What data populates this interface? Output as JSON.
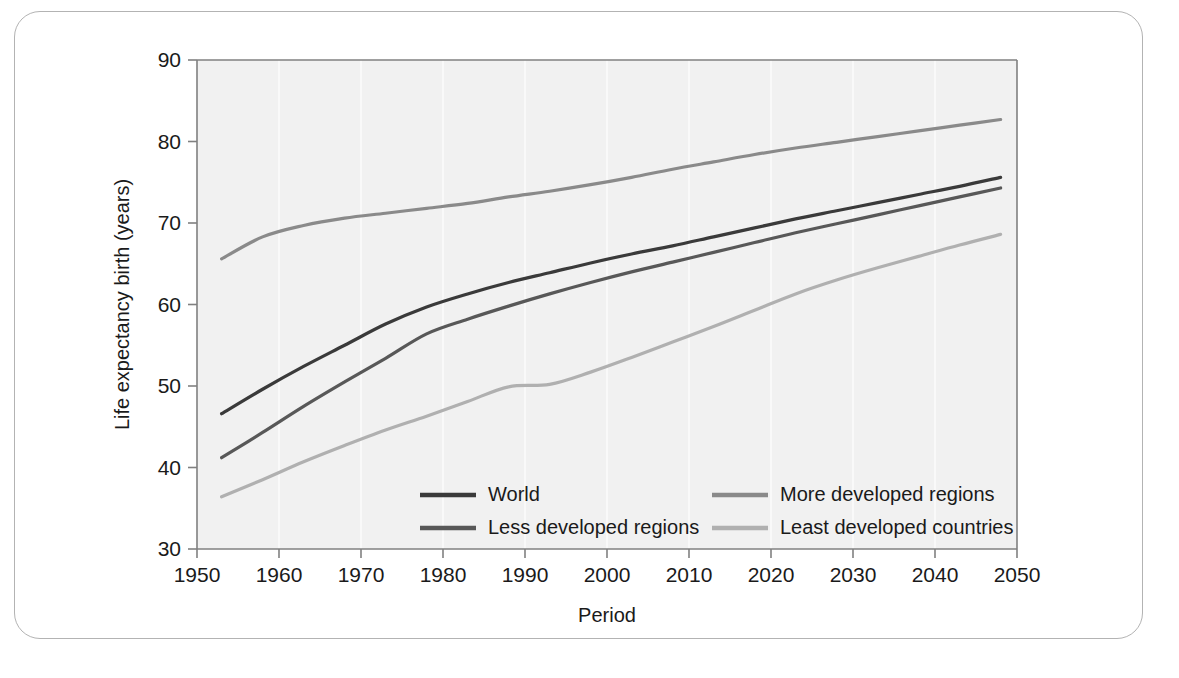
{
  "figure": {
    "background": "#ffffff",
    "frame_color": "#b3b3b3",
    "plot_background": "#f1f1f1"
  },
  "chart_data": {
    "type": "line",
    "title": "",
    "xlabel": "Period",
    "ylabel": "Life expectancy birth (years)",
    "xlim": [
      1950,
      2050
    ],
    "ylim": [
      30,
      90
    ],
    "xticks": [
      1950,
      1960,
      1970,
      1980,
      1990,
      2000,
      2010,
      2020,
      2030,
      2040,
      2050
    ],
    "yticks": [
      30,
      40,
      50,
      60,
      70,
      80,
      90
    ],
    "xtick_labels": [
      "1950",
      "1960",
      "1970",
      "1980",
      "1990",
      "2000",
      "2010",
      "2020",
      "2030",
      "2040",
      "2050"
    ],
    "ytick_labels": [
      "30",
      "40",
      "50",
      "60",
      "70",
      "80",
      "90"
    ],
    "grid": "vertical-only-faint-white",
    "legend_position": "inside-lower-center",
    "x": [
      1953,
      1958,
      1963,
      1968,
      1973,
      1978,
      1983,
      1988,
      1993,
      1998,
      2003,
      2008,
      2013,
      2018,
      2023,
      2028,
      2033,
      2038,
      2043,
      2048
    ],
    "series": [
      {
        "name": "World",
        "color": "#3a3a3a",
        "width": 3.2,
        "values": [
          46.6,
          49.6,
          52.4,
          55.0,
          57.6,
          59.7,
          61.3,
          62.7,
          63.9,
          65.1,
          66.2,
          67.2,
          68.3,
          69.4,
          70.5,
          71.5,
          72.5,
          73.5,
          74.5,
          75.6
        ]
      },
      {
        "name": "Less developed regions",
        "color": "#585858",
        "width": 3.2,
        "values": [
          41.2,
          44.3,
          47.5,
          50.5,
          53.4,
          56.4,
          58.2,
          59.8,
          61.3,
          62.7,
          64.0,
          65.2,
          66.4,
          67.6,
          68.8,
          69.9,
          71.0,
          72.1,
          73.2,
          74.3
        ]
      },
      {
        "name": "More developed regions",
        "color": "#8a8a8a",
        "width": 3.2,
        "values": [
          65.6,
          68.3,
          69.7,
          70.6,
          71.2,
          71.8,
          72.4,
          73.2,
          73.9,
          74.7,
          75.6,
          76.6,
          77.5,
          78.4,
          79.2,
          79.9,
          80.6,
          81.3,
          82.0,
          82.7
        ]
      },
      {
        "name": "Least developed countries",
        "color": "#b0b0b0",
        "width": 3.2,
        "values": [
          36.4,
          38.5,
          40.7,
          42.7,
          44.6,
          46.3,
          48.1,
          49.9,
          50.2,
          51.7,
          53.5,
          55.4,
          57.3,
          59.3,
          61.3,
          63.0,
          64.5,
          65.9,
          67.3,
          68.6
        ]
      }
    ]
  },
  "legend": {
    "entries": [
      {
        "label": "World",
        "color": "#3a3a3a"
      },
      {
        "label": "More developed regions",
        "color": "#8a8a8a"
      },
      {
        "label": "Less developed regions",
        "color": "#585858"
      },
      {
        "label": "Least developed countries",
        "color": "#b0b0b0"
      }
    ]
  }
}
